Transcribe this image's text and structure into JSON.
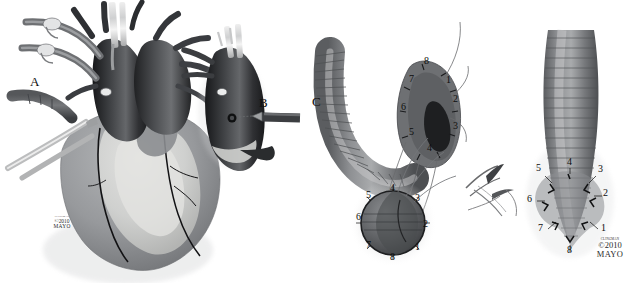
{
  "figure": {
    "type": "medical-surgical-illustration",
    "background_color": "#ffffff",
    "rendering": "grayscale halftone airbrush",
    "width": 640,
    "height": 283
  },
  "panels": [
    {
      "id": "A",
      "letter": "A",
      "x": 36,
      "y": 83,
      "caption": "Heart in situ with aortic and venous cannulae, clamps, and retractors exposing the aortic root"
    },
    {
      "id": "B",
      "letter": "B",
      "x": 265,
      "y": 104,
      "caption": "Isolated aortic root segment with instrument approaching the coronary ostium"
    },
    {
      "id": "C",
      "letter": "C",
      "x": 318,
      "y": 103,
      "caption": "Curved corrugated vascular graft anastomosed to the aortic root with eight numbered suture positions"
    },
    {
      "id": "D",
      "letter": "",
      "x": 0,
      "y": 0,
      "caption": "Completed graft seen end-on with eight numbered sutures distributed circumferentially"
    }
  ],
  "suture_labels": {
    "graft_side_view": [
      {
        "n": "8",
        "x": 427,
        "y": 62
      },
      {
        "n": "7",
        "x": 412,
        "y": 80
      },
      {
        "n": "1",
        "x": 449,
        "y": 81
      },
      {
        "n": "6",
        "x": 404,
        "y": 108
      },
      {
        "n": "2",
        "x": 456,
        "y": 100
      },
      {
        "n": "5",
        "x": 412,
        "y": 133
      },
      {
        "n": "3",
        "x": 456,
        "y": 127
      },
      {
        "n": "4",
        "x": 430,
        "y": 149
      }
    ],
    "cross_section": [
      {
        "n": "4",
        "x": 393,
        "y": 189
      },
      {
        "n": "5",
        "x": 369,
        "y": 196
      },
      {
        "n": "3",
        "x": 418,
        "y": 199
      },
      {
        "n": "6",
        "x": 359,
        "y": 218
      },
      {
        "n": "2",
        "x": 426,
        "y": 225
      },
      {
        "n": "7",
        "x": 369,
        "y": 246
      },
      {
        "n": "1",
        "x": 418,
        "y": 248
      },
      {
        "n": "8",
        "x": 393,
        "y": 258
      }
    ],
    "right_panel": [
      {
        "n": "4",
        "x": 570,
        "y": 163
      },
      {
        "n": "5",
        "x": 539,
        "y": 169
      },
      {
        "n": "3",
        "x": 601,
        "y": 170
      },
      {
        "n": "6",
        "x": 530,
        "y": 200
      },
      {
        "n": "2",
        "x": 606,
        "y": 194
      },
      {
        "n": "7",
        "x": 541,
        "y": 229
      },
      {
        "n": "1",
        "x": 604,
        "y": 229
      },
      {
        "n": "8",
        "x": 570,
        "y": 251
      }
    ]
  },
  "copyright": {
    "artist_line": "CLINGMAN",
    "year_line": "©2010",
    "org_line": "MAYO",
    "instances": [
      {
        "x": 62,
        "y": 222,
        "size": "small"
      },
      {
        "x": 610,
        "y": 252,
        "size": "normal"
      }
    ]
  },
  "colors": {
    "background": "#ffffff",
    "ink": "#0d0d0d",
    "vessel_dark": "#2f3033",
    "vessel_mid": "#5d5f62",
    "myocardium": "#8e9094",
    "epicardial_fat": "#d2d3d2",
    "graft_gray": "#6f7174",
    "instrument_steel": "#c9cacb",
    "suture_thread": "#6a6b6d",
    "shadow": "#1a1b1d"
  }
}
